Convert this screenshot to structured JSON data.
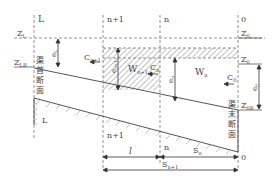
{
  "labels": {
    "section_L": "L",
    "section_n1": "n+1",
    "section_n": "n",
    "section_0": "0",
    "ZL": "Z",
    "ZL_sub": "L",
    "Z0p": "Z",
    "Z0p_sub": "0",
    "ZLB": "Z",
    "ZLB_sub": "LB",
    "Z0": "Z",
    "Z0_sub": "0",
    "Z0B": "Z",
    "Z0B_sub": "0B",
    "eL": "e",
    "eL_sub": "L",
    "en1": "e",
    "en1_sub": "n+1",
    "en": "e",
    "en_sub": "n",
    "e0": "e",
    "e0_sub": "0",
    "Cn1": "C",
    "Cn1_sub": "n+1",
    "Cn": "C",
    "Cn_sub": "n",
    "C0": "C",
    "C0_sub": "0",
    "Wn1": "W",
    "Wn1_sub": "n+1",
    "Wn": "W",
    "Wn_sub": "n",
    "head_section": [
      "渠",
      "首",
      "断",
      "面"
    ],
    "tail_section": [
      "渠",
      "末",
      "断",
      "面"
    ],
    "bottom_L": "L",
    "bottom_n1": "n+1",
    "bottom_n": "n",
    "bottom_0": "0",
    "dist_l": "l",
    "dist_Sn": "S",
    "dist_Sn_sub": "n",
    "dist_Sn1": "S",
    "dist_Sn1_sub": "n+1"
  },
  "colors": {
    "line": "#555555",
    "hatch": "#888888",
    "text": "#444444"
  }
}
